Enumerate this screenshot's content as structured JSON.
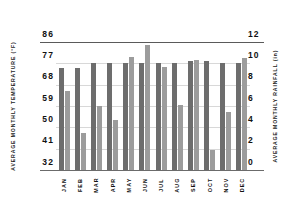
{
  "chart_data": {
    "type": "bar",
    "title": "",
    "subtitle": "",
    "categories": [
      "JAN",
      "FEB",
      "MAR",
      "APR",
      "MAY",
      "JUN",
      "JUL",
      "AUG",
      "SEP",
      "OCT",
      "NOV",
      "DEC"
    ],
    "series": [
      {
        "name": "Average Monthly Temperature",
        "unit": "°F",
        "axis": "left",
        "color": "#6d6d6d",
        "values": [
          75,
          75,
          77,
          77,
          77,
          77,
          77,
          77,
          78,
          78,
          77,
          77
        ]
      },
      {
        "name": "Average Monthly Rainfall",
        "unit": "in",
        "axis": "right",
        "color": "#9c9c9c",
        "values": [
          7.4,
          3.5,
          6.0,
          4.7,
          10.6,
          11.7,
          9.7,
          6.1,
          10.3,
          1.9,
          5.4,
          10.5
        ]
      }
    ],
    "xlabel": "",
    "ylabel_left": "AVERAGE MONTHLY TEMPERATURE (°F)",
    "ylabel_right": "AVERAGE MONTHLY RAINFALL (in)",
    "y_left_ticks": [
      "86",
      "77",
      "68",
      "59",
      "50",
      "41",
      "32"
    ],
    "y_right_ticks": [
      "12",
      "10",
      "8",
      "6",
      "4",
      "2",
      "0"
    ],
    "ylim_left": [
      32,
      86
    ],
    "ylim_right": [
      0,
      12
    ],
    "grid": true,
    "legend": "none",
    "colors": {
      "temperature_bar": "#6d6d6d",
      "rainfall_bar": "#9c9c9c",
      "gridline": "#d8d8d8",
      "axis_rule": "#5a5a5a",
      "text": "#111111",
      "background": "#ffffff"
    }
  }
}
